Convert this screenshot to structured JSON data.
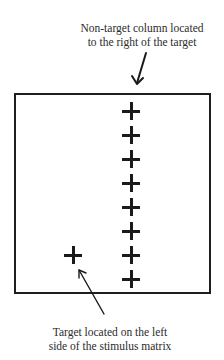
{
  "annotations": {
    "top": {
      "line1": "Non-target column located",
      "line2": "to the right of the target"
    },
    "bottom": {
      "line1": "Target located on the left",
      "line2": "side of the stimulus matrix"
    }
  },
  "stimulus_matrix": {
    "non_target_column": {
      "symbol": "+",
      "count": 8,
      "position": "right of center"
    },
    "target": {
      "symbol": "+",
      "position": "left side, row 7"
    }
  },
  "colors": {
    "stroke": "#1a1a1a",
    "background": "#ffffff",
    "text": "#2b2b2b"
  }
}
